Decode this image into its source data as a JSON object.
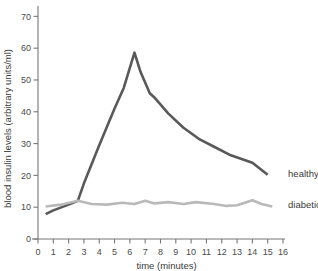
{
  "chart_data": {
    "type": "line",
    "title": "",
    "xlabel": "time (minutes)",
    "ylabel": "blood insulin levels (arbitrary units/ml)",
    "xlim": [
      0,
      16
    ],
    "ylim": [
      0,
      72
    ],
    "xticks": [
      0,
      1,
      2,
      3,
      4,
      5,
      6,
      7,
      8,
      9,
      10,
      11,
      12,
      13,
      14,
      15,
      16
    ],
    "yticks": [
      0,
      10,
      20,
      30,
      40,
      50,
      60,
      70
    ],
    "xtick_labels": [
      "0",
      "1",
      "2",
      "3",
      "4",
      "5",
      "6",
      "7",
      "8",
      "9",
      "10",
      "11",
      "12",
      "13",
      "14",
      "15",
      "16"
    ],
    "ytick_labels": [
      "0",
      "10",
      "20",
      "30",
      "40",
      "50",
      "60",
      "70"
    ],
    "grid": false,
    "legend_position": "right-inline",
    "series": [
      {
        "name": "healthy",
        "color": "#595959",
        "width": 2.6,
        "label_x": 16.2,
        "label_y": 20.5,
        "points": [
          [
            0.5,
            7.8
          ],
          [
            1.0,
            9.0
          ],
          [
            2.0,
            10.8
          ],
          [
            2.6,
            12.0
          ],
          [
            3.0,
            17.5
          ],
          [
            4.0,
            29.5
          ],
          [
            5.0,
            41.0
          ],
          [
            5.6,
            47.5
          ],
          [
            6.3,
            58.6
          ],
          [
            6.7,
            52.5
          ],
          [
            7.3,
            45.8
          ],
          [
            7.6,
            44.5
          ],
          [
            8.5,
            39.5
          ],
          [
            9.5,
            35.0
          ],
          [
            10.5,
            31.5
          ],
          [
            11.5,
            29.0
          ],
          [
            12.5,
            26.5
          ],
          [
            14.0,
            24.0
          ],
          [
            15.0,
            20.2
          ]
        ]
      },
      {
        "name": "diabetic",
        "color": "#b9b9b9",
        "width": 2.6,
        "label_x": 16.2,
        "label_y": 11.0,
        "points": [
          [
            0.5,
            10.2
          ],
          [
            1.5,
            10.8
          ],
          [
            2.6,
            12.0
          ],
          [
            3.5,
            11.0
          ],
          [
            4.5,
            10.8
          ],
          [
            5.5,
            11.4
          ],
          [
            6.3,
            11.0
          ],
          [
            7.0,
            12.0
          ],
          [
            7.6,
            11.2
          ],
          [
            8.5,
            11.6
          ],
          [
            9.5,
            11.0
          ],
          [
            10.3,
            11.6
          ],
          [
            11.5,
            11.0
          ],
          [
            12.3,
            10.4
          ],
          [
            13.0,
            10.6
          ],
          [
            14.0,
            12.2
          ],
          [
            14.6,
            11.0
          ],
          [
            15.3,
            10.2
          ]
        ]
      }
    ]
  },
  "axes": {
    "y_axis_title": "blood insulin levels (arbitrary units/ml)",
    "x_axis_title": "time (minutes)"
  },
  "legend": {
    "healthy_label": "healthy",
    "diabetic_label": "diabetic"
  }
}
